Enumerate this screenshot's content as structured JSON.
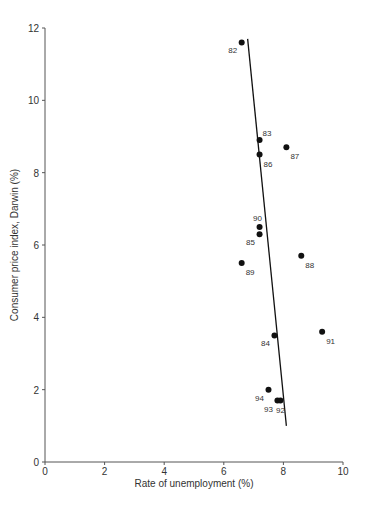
{
  "chart_data": {
    "type": "scatter",
    "title": "",
    "xlabel": "Rate of unemployment (%)",
    "ylabel": "Consumer price index, Darwin (%)",
    "xlim": [
      0,
      10
    ],
    "ylim": [
      0,
      12
    ],
    "xticks": [
      0,
      2,
      4,
      6,
      8,
      10
    ],
    "yticks": [
      0,
      2,
      4,
      6,
      8,
      10,
      12
    ],
    "grid": false,
    "legend": null,
    "points": [
      {
        "label": "82",
        "x": 6.6,
        "y": 11.6,
        "label_pos": "bottom-left"
      },
      {
        "label": "83",
        "x": 7.2,
        "y": 8.9,
        "label_pos": "top-right"
      },
      {
        "label": "86",
        "x": 7.2,
        "y": 8.5,
        "label_pos": "bottom-right"
      },
      {
        "label": "87",
        "x": 8.1,
        "y": 8.7,
        "label_pos": "bottom-right"
      },
      {
        "label": "90",
        "x": 7.2,
        "y": 6.5,
        "label_pos": "top"
      },
      {
        "label": "85",
        "x": 7.2,
        "y": 6.3,
        "label_pos": "bottom-left"
      },
      {
        "label": "89",
        "x": 6.6,
        "y": 5.5,
        "label_pos": "bottom-right"
      },
      {
        "label": "88",
        "x": 8.6,
        "y": 5.7,
        "label_pos": "bottom-right"
      },
      {
        "label": "84",
        "x": 7.7,
        "y": 3.5,
        "label_pos": "bottom-left"
      },
      {
        "label": "91",
        "x": 9.3,
        "y": 3.6,
        "label_pos": "bottom-right"
      },
      {
        "label": "94",
        "x": 7.5,
        "y": 2.0,
        "label_pos": "bottom-left"
      },
      {
        "label": "93",
        "x": 7.8,
        "y": 1.7,
        "label_pos": "bottom-left"
      },
      {
        "label": "92",
        "x": 7.9,
        "y": 1.7,
        "label_pos": "bottom"
      }
    ],
    "trend_line": {
      "x1": 6.8,
      "y1": 11.7,
      "x2": 8.1,
      "y2": 1.0
    },
    "colors": {
      "points": "#111111",
      "line": "#111111",
      "axes": "#555555",
      "text": "#333333"
    }
  }
}
